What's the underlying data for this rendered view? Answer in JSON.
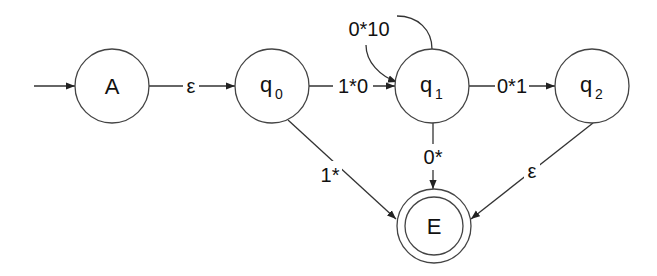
{
  "diagram": {
    "type": "finite automaton (state diagram)",
    "states": [
      {
        "id": "A",
        "label": "A",
        "start": true,
        "accepting": false
      },
      {
        "id": "q0",
        "label": "q",
        "subscript": "0",
        "start": false,
        "accepting": false
      },
      {
        "id": "q1",
        "label": "q",
        "subscript": "1",
        "start": false,
        "accepting": false
      },
      {
        "id": "q2",
        "label": "q",
        "subscript": "2",
        "start": false,
        "accepting": false
      },
      {
        "id": "E",
        "label": "E",
        "start": false,
        "accepting": true
      }
    ],
    "transitions": [
      {
        "from": "A",
        "to": "q0",
        "label": "ε"
      },
      {
        "from": "q0",
        "to": "q1",
        "label": "1*0"
      },
      {
        "from": "q1",
        "to": "q1",
        "label": "0*10"
      },
      {
        "from": "q1",
        "to": "q2",
        "label": "0*1"
      },
      {
        "from": "q0",
        "to": "E",
        "label": "1*"
      },
      {
        "from": "q1",
        "to": "E",
        "label": "0*"
      },
      {
        "from": "q2",
        "to": "E",
        "label": "ε"
      }
    ]
  },
  "colors": {
    "stroke": "#444444",
    "text": "#111111",
    "background": "#ffffff"
  }
}
